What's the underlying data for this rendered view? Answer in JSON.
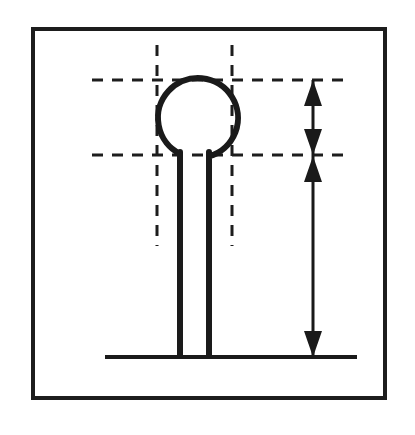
{
  "figure": {
    "title": "Ball-end pin dimensioned drawing",
    "background_color": "#ffffff",
    "ink_color": "#1a1a1a",
    "labels": [],
    "annotation_text": ""
  },
  "border": {
    "name": "drawing-frame",
    "x": 33,
    "y": 29,
    "width": 352,
    "height": 369,
    "stroke_width": 4,
    "color": "#1d1d1d"
  },
  "geometry": {
    "ball": {
      "center_x": 198,
      "center_y": 118,
      "radius": 40,
      "stroke_width": 6
    },
    "shank": {
      "left_x": 180,
      "right_x": 209,
      "top_y": 152,
      "bottom_y": 357,
      "stroke_width": 6
    },
    "baseline": {
      "x1": 105,
      "x2": 357,
      "y": 357,
      "stroke_width": 4
    }
  },
  "centerlines": {
    "color": "#1d1d1d",
    "stroke_width": 3,
    "dash": "11 9",
    "horizontal": [
      {
        "name": "top-centerline",
        "x1": 92,
        "x2": 352,
        "y": 80
      },
      {
        "name": "neck-centerline",
        "x1": 92,
        "x2": 352,
        "y": 155
      }
    ],
    "vertical": [
      {
        "name": "left-centerline",
        "x": 157,
        "y1": 45,
        "y2": 246
      },
      {
        "name": "right-centerline",
        "x": 232,
        "y1": 45,
        "y2": 246
      }
    ]
  },
  "dimension": {
    "name": "overall-height-dimension",
    "line_x": 313,
    "top_y": 80,
    "bottom_y": 357,
    "mid_y": 155,
    "stroke_width": 3,
    "arrow_half_width": 9,
    "arrow_length": 26,
    "value_label": "",
    "arrows": [
      {
        "name": "dimension-arrow-top",
        "direction": "up",
        "tip_y": 80
      },
      {
        "name": "dimension-arrow-mid-down",
        "direction": "down",
        "tip_y": 155
      },
      {
        "name": "dimension-arrow-mid-up",
        "direction": "up",
        "tip_y": 156
      },
      {
        "name": "dimension-arrow-bottom",
        "direction": "down",
        "tip_y": 357
      }
    ]
  }
}
